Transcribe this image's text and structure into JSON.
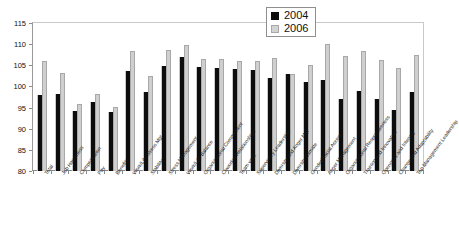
{
  "chart_data": {
    "type": "bar",
    "title": "",
    "xlabel": "",
    "ylabel": "",
    "ylim": [
      80,
      115
    ],
    "yticks": [
      80,
      85,
      90,
      95,
      100,
      105,
      110,
      115
    ],
    "grid": false,
    "legend_position": "top-right",
    "categories": [
      "Total",
      "Job Happiness",
      "Compensation",
      "Pay",
      "Benefits",
      "Work/Life Stress Mgt",
      "Stability",
      "Stress Management",
      "Work/Life Balance",
      "Organizational Commitment",
      "Coworker Relationships",
      "Team work",
      "Supervisory Leadership",
      "Diversity and Anger Mgt",
      "Diversity Climate",
      "Gender/Racial Accent",
      "Anger Management",
      "Organizational Responsiveness",
      "Training and Innovation",
      "Openness and Integrity",
      "Change and Adaptability",
      "Top Management Leadership"
    ],
    "series": [
      {
        "name": "2004",
        "color": "#0d0d0d",
        "values": [
          98.0,
          98.2,
          94.2,
          96.4,
          94.0,
          103.6,
          98.8,
          104.8,
          107.0,
          104.5,
          104.3,
          104.2,
          103.9,
          102.1,
          103.0,
          101.0,
          101.6,
          97.0,
          99.0,
          97.0,
          94.5,
          98.8
        ]
      },
      {
        "name": "2006",
        "color": "#cfcfcf",
        "values": [
          106.1,
          103.1,
          95.9,
          98.2,
          95.1,
          108.4,
          102.5,
          108.6,
          109.7,
          106.6,
          106.5,
          105.9,
          106.0,
          106.8,
          103.0,
          105.0,
          110.1,
          107.3,
          108.5,
          106.3,
          104.4,
          107.5
        ]
      }
    ]
  },
  "legend": {
    "items": [
      {
        "label": "2004",
        "swatch": "black-square-swatch"
      },
      {
        "label": "2006",
        "swatch": "gray-square-swatch"
      }
    ]
  }
}
